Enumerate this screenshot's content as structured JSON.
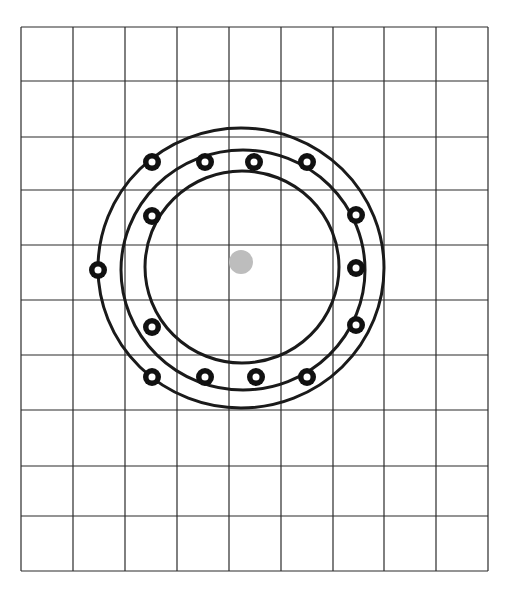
{
  "diagram": {
    "type": "grid-with-concentric-rings",
    "grid": {
      "x": [
        21,
        73,
        125,
        177,
        229,
        281,
        333,
        384,
        436,
        488
      ],
      "y": [
        27,
        81,
        137,
        190,
        245,
        300,
        355,
        410,
        466,
        516,
        571
      ],
      "columns": 9,
      "rows": 10,
      "line_color": "#2a2a2a"
    },
    "center_dot": {
      "cx": 241,
      "cy": 262,
      "r": 12,
      "color": "#bdbdbd"
    },
    "rings": [
      {
        "name": "outer-ring",
        "cx": 241,
        "cy": 268,
        "rx": 143,
        "ry": 140
      },
      {
        "name": "middle-ring",
        "cx": 243,
        "cy": 270,
        "rx": 122,
        "ry": 120
      },
      {
        "name": "inner-ring",
        "cx": 242,
        "cy": 267,
        "rx": 97,
        "ry": 96
      }
    ],
    "ring_color": "#1a1a1a",
    "nodes": [
      {
        "cx": 98,
        "cy": 270
      },
      {
        "cx": 152,
        "cy": 162
      },
      {
        "cx": 205,
        "cy": 162
      },
      {
        "cx": 254,
        "cy": 162
      },
      {
        "cx": 307,
        "cy": 162
      },
      {
        "cx": 152,
        "cy": 216
      },
      {
        "cx": 356,
        "cy": 215
      },
      {
        "cx": 356,
        "cy": 268
      },
      {
        "cx": 152,
        "cy": 327
      },
      {
        "cx": 356,
        "cy": 325
      },
      {
        "cx": 152,
        "cy": 377
      },
      {
        "cx": 205,
        "cy": 377
      },
      {
        "cx": 256,
        "cy": 377
      },
      {
        "cx": 307,
        "cy": 377
      }
    ],
    "node_style": {
      "outer_r": 9,
      "hole_r": 3.5,
      "color": "#111111"
    }
  }
}
